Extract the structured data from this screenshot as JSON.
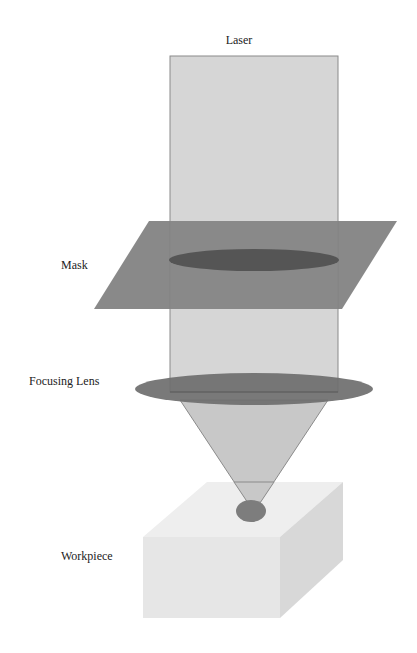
{
  "diagram": {
    "labels": {
      "laser": "Laser",
      "mask": "Mask",
      "lens": "Focusing Lens",
      "workpiece": "Workpiece"
    },
    "colors": {
      "background": "#ffffff",
      "beam": "#d6d6d6",
      "beam_edge": "#8a8a8a",
      "mask_plane": "#7f7f7f",
      "mask_aperture": "#555555",
      "lens": "#6e6e6e",
      "cone": "#c8c8c8",
      "spot": "#7d7d7d",
      "workpiece_top": "#eeeeee",
      "workpiece_front": "#e6e6e6",
      "workpiece_side": "#dadada"
    }
  }
}
